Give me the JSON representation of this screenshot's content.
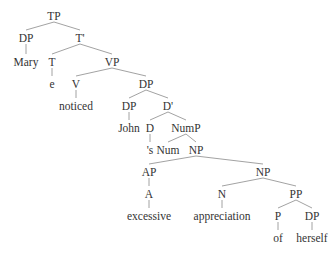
{
  "diagram": {
    "type": "syntax-tree",
    "nodes": [
      {
        "id": "tp",
        "label": "TP",
        "x": 54,
        "y": 16
      },
      {
        "id": "dp1",
        "label": "DP",
        "x": 26,
        "y": 38
      },
      {
        "id": "mary",
        "label": "Mary",
        "x": 26,
        "y": 62
      },
      {
        "id": "tbar",
        "label": "T'",
        "x": 80,
        "y": 38
      },
      {
        "id": "t",
        "label": "T",
        "x": 52,
        "y": 62
      },
      {
        "id": "e",
        "label": "e",
        "x": 52,
        "y": 84
      },
      {
        "id": "vp",
        "label": "VP",
        "x": 112,
        "y": 62
      },
      {
        "id": "v",
        "label": "V",
        "x": 76,
        "y": 84
      },
      {
        "id": "noticed",
        "label": "noticed",
        "x": 76,
        "y": 106
      },
      {
        "id": "dp2",
        "label": "DP",
        "x": 146,
        "y": 84
      },
      {
        "id": "dp3",
        "label": "DP",
        "x": 129,
        "y": 106
      },
      {
        "id": "john",
        "label": "John",
        "x": 129,
        "y": 128
      },
      {
        "id": "dbar",
        "label": "D'",
        "x": 168,
        "y": 106
      },
      {
        "id": "d",
        "label": "D",
        "x": 150,
        "y": 128
      },
      {
        "id": "s",
        "label": "'s",
        "x": 150,
        "y": 150
      },
      {
        "id": "nump",
        "label": "NumP",
        "x": 186,
        "y": 128
      },
      {
        "id": "num",
        "label": "Num",
        "x": 168,
        "y": 150
      },
      {
        "id": "np1",
        "label": "NP",
        "x": 196,
        "y": 150
      },
      {
        "id": "ap",
        "label": "AP",
        "x": 149,
        "y": 172
      },
      {
        "id": "a",
        "label": "A",
        "x": 149,
        "y": 194
      },
      {
        "id": "excessive",
        "label": "excessive",
        "x": 149,
        "y": 216
      },
      {
        "id": "np2",
        "label": "NP",
        "x": 263,
        "y": 172
      },
      {
        "id": "n",
        "label": "N",
        "x": 222,
        "y": 194
      },
      {
        "id": "appreciation",
        "label": "appreciation",
        "x": 222,
        "y": 216
      },
      {
        "id": "pp",
        "label": "PP",
        "x": 296,
        "y": 194
      },
      {
        "id": "p",
        "label": "P",
        "x": 278,
        "y": 216
      },
      {
        "id": "of",
        "label": "of",
        "x": 278,
        "y": 238
      },
      {
        "id": "dp4",
        "label": "DP",
        "x": 312,
        "y": 216
      },
      {
        "id": "herself",
        "label": "herself",
        "x": 312,
        "y": 238
      }
    ],
    "edges": [
      [
        "tp",
        "dp1"
      ],
      [
        "tp",
        "tbar"
      ],
      [
        "dp1",
        "mary"
      ],
      [
        "tbar",
        "t"
      ],
      [
        "tbar",
        "vp"
      ],
      [
        "t",
        "e"
      ],
      [
        "vp",
        "v"
      ],
      [
        "vp",
        "dp2"
      ],
      [
        "v",
        "noticed"
      ],
      [
        "dp2",
        "dp3"
      ],
      [
        "dp2",
        "dbar"
      ],
      [
        "dp3",
        "john"
      ],
      [
        "dbar",
        "d"
      ],
      [
        "dbar",
        "nump"
      ],
      [
        "d",
        "s"
      ],
      [
        "nump",
        "num"
      ],
      [
        "nump",
        "np1"
      ],
      [
        "np1",
        "ap"
      ],
      [
        "np1",
        "np2"
      ],
      [
        "ap",
        "a"
      ],
      [
        "a",
        "excessive"
      ],
      [
        "np2",
        "n"
      ],
      [
        "np2",
        "pp"
      ],
      [
        "n",
        "appreciation"
      ],
      [
        "pp",
        "p"
      ],
      [
        "pp",
        "dp4"
      ],
      [
        "p",
        "of"
      ],
      [
        "dp4",
        "herself"
      ]
    ]
  }
}
